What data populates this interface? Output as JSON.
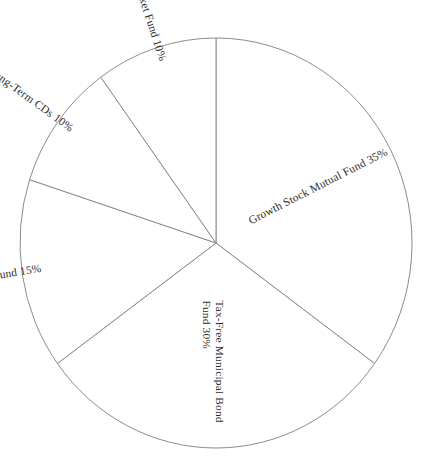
{
  "chart_data": {
    "type": "pie",
    "title": "",
    "subtitle": "",
    "xlabel": "",
    "ylabel": "",
    "legend_position": "none",
    "grid": false,
    "units": "percent",
    "start_angle_deg": 0,
    "direction": "clockwise",
    "categories": [
      "Growth Stock Mutual Fund",
      "Tax-Free Municipal Bond Fund",
      "Small-Cap Equities Fund",
      "Long-Term CDs",
      "Money Market Fund"
    ],
    "values": [
      35,
      30,
      15,
      10,
      10
    ],
    "slices": [
      {
        "name": "Growth Stock Mutual Fund",
        "value": 35,
        "label": "Growth Stock Mutual Fund 35%",
        "label_lines": [
          "Growth Stock Mutual Fund 35%"
        ],
        "percent_text": "35%",
        "angle_deg": 126,
        "start_deg": 0,
        "end_deg": 126,
        "mid_deg": 63,
        "label_rotation_deg": -27,
        "label_anchor": "start",
        "label_radius_frac": 0.2,
        "fill": "#ffffff",
        "stroke": "#8c8c8c"
      },
      {
        "name": "Tax-Free Municipal Bond Fund",
        "value": 30,
        "label": "Tax-Free Municipal Bond Fund 30%",
        "label_lines": [
          "Tax-Free Municipal Bond",
          "Fund 30%"
        ],
        "percent_text": "30%",
        "angle_deg": 108,
        "start_deg": 126,
        "end_deg": 234,
        "mid_deg": 180,
        "label_rotation_deg": 90,
        "label_anchor": "start",
        "label_radius_frac": 0.28,
        "fill": "#ffffff",
        "stroke": "#8c8c8c"
      },
      {
        "name": "Small-Cap Equities Fund",
        "value": 15,
        "label": "Small-Cap Equities Fund 15%",
        "label_lines": [
          "Small-Cap Equities Fund 15%"
        ],
        "percent_text": "15%",
        "angle_deg": 54,
        "start_deg": 234,
        "end_deg": 288,
        "mid_deg": 261,
        "label_rotation_deg": -9,
        "label_anchor": "end",
        "label_radius_frac": 0.9,
        "fill": "#ffffff",
        "stroke": "#8c8c8c"
      },
      {
        "name": "Long-Term CDs",
        "value": 10,
        "label": "Long-Term CDs 10%",
        "label_lines": [
          "Long-Term CDs 10%"
        ],
        "percent_text": "10%",
        "angle_deg": 36,
        "start_deg": 288,
        "end_deg": 324,
        "mid_deg": 306,
        "label_rotation_deg": 36,
        "label_anchor": "end",
        "label_radius_frac": 0.92,
        "fill": "#ffffff",
        "stroke": "#8c8c8c"
      },
      {
        "name": "Money Market Fund",
        "value": 10,
        "label": "Money Market Fund 10%",
        "label_lines": [
          "Money Market Fund 10%"
        ],
        "percent_text": "10%",
        "angle_deg": 36,
        "start_deg": 324,
        "end_deg": 360,
        "mid_deg": 342,
        "label_rotation_deg": 72,
        "label_anchor": "end",
        "label_radius_frac": 0.93,
        "fill": "#ffffff",
        "stroke": "#8c8c8c"
      }
    ],
    "geometry": {
      "center_x": 216,
      "center_y": 243,
      "radius_x": 196,
      "radius_y": 205
    },
    "style": {
      "background": "#ffffff",
      "stroke_color": "#8c8c8c",
      "stroke_width": 1,
      "label_color": "#2e2b28",
      "label_font_size": 11.4
    }
  }
}
